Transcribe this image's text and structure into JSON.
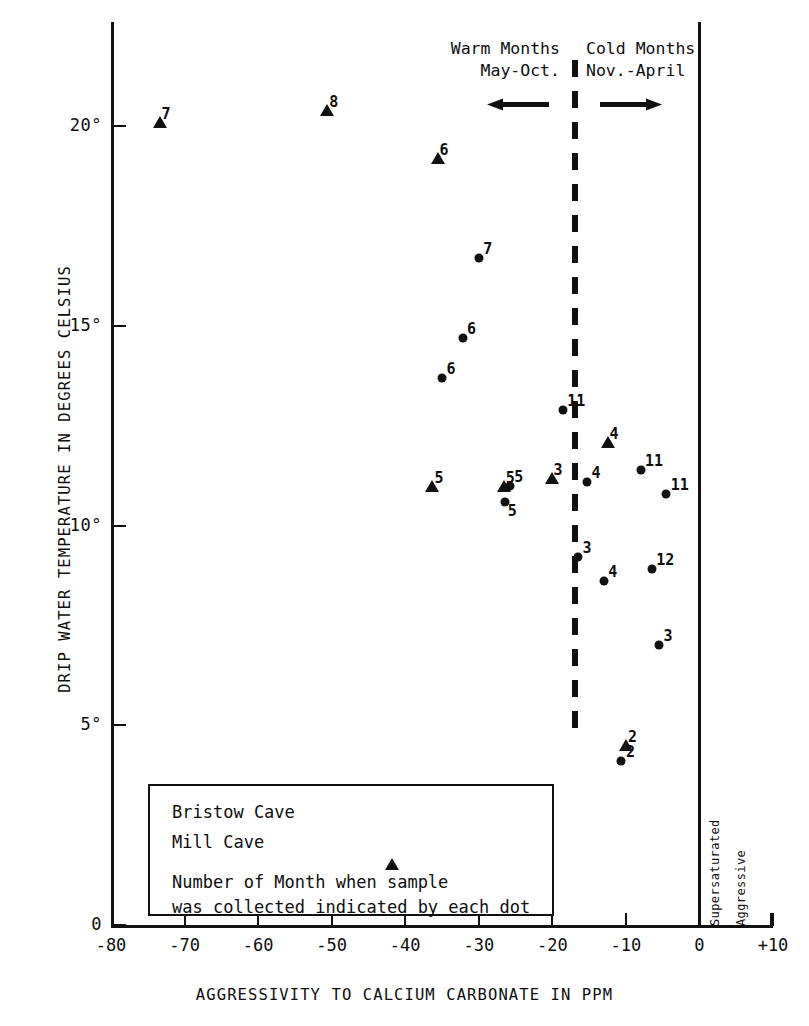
{
  "chart_data": {
    "type": "scatter",
    "title": "",
    "xlabel": "AGGRESSIVITY TO CALCIUM CARBONATE IN PPM",
    "ylabel": "DRIP WATER TEMPERATURE IN DEGREES CELSIUS",
    "xlim": [
      -80,
      10
    ],
    "ylim": [
      0,
      22.5
    ],
    "xticks": [
      "-80",
      "-70",
      "-60",
      "-50",
      "-40",
      "-30",
      "-20",
      "-10",
      "0",
      "+10"
    ],
    "xtick_values": [
      -80,
      -70,
      -60,
      -50,
      -40,
      -30,
      -20,
      -10,
      0,
      10
    ],
    "yticks": [
      "0",
      "5°",
      "10°",
      "15°",
      "20°"
    ],
    "ytick_values": [
      0,
      5,
      10,
      15,
      20
    ],
    "grid": false,
    "legend_position": "inside-lower-left",
    "series": [
      {
        "name": "Bristow Cave",
        "marker": "circle",
        "points": [
          {
            "x": -30.0,
            "y": 16.7,
            "label": "7"
          },
          {
            "x": -32.2,
            "y": 14.7,
            "label": "6"
          },
          {
            "x": -35.0,
            "y": 13.7,
            "label": "6"
          },
          {
            "x": -18.6,
            "y": 12.9,
            "label": "11"
          },
          {
            "x": -8.0,
            "y": 11.4,
            "label": "11"
          },
          {
            "x": -4.5,
            "y": 10.8,
            "label": "11"
          },
          {
            "x": -25.8,
            "y": 11.0,
            "label": "5"
          },
          {
            "x": -26.4,
            "y": 10.6,
            "label": "5"
          },
          {
            "x": -15.3,
            "y": 11.1,
            "label": "4"
          },
          {
            "x": -16.5,
            "y": 9.2,
            "label": "3"
          },
          {
            "x": -13.0,
            "y": 8.6,
            "label": "4"
          },
          {
            "x": -6.5,
            "y": 8.9,
            "label": "12"
          },
          {
            "x": -5.5,
            "y": 7.0,
            "label": "3"
          },
          {
            "x": -10.6,
            "y": 4.1,
            "label": "2"
          }
        ]
      },
      {
        "name": "Mill Cave",
        "marker": "triangle",
        "points": [
          {
            "x": -73.4,
            "y": 20.1,
            "label": "7"
          },
          {
            "x": -50.6,
            "y": 20.4,
            "label": "8"
          },
          {
            "x": -35.6,
            "y": 19.2,
            "label": "6"
          },
          {
            "x": -36.3,
            "y": 11.0,
            "label": "5"
          },
          {
            "x": -26.6,
            "y": 11.0,
            "label": "5"
          },
          {
            "x": -20.1,
            "y": 11.2,
            "label": "3"
          },
          {
            "x": -12.5,
            "y": 12.1,
            "label": "4"
          },
          {
            "x": -10.0,
            "y": 4.5,
            "label": "2"
          }
        ]
      }
    ],
    "annotations": {
      "divider_x": -20,
      "divider_style": "dashed-vertical",
      "warm": {
        "line1": "Warm Months",
        "line2": "May-Oct.",
        "arrow": "left"
      },
      "cold": {
        "line1": "Cold Months",
        "line2": "Nov.-April",
        "arrow": "right"
      },
      "zero_line_left_label": "Supersaturated",
      "zero_line_right_label": "Aggressive"
    }
  },
  "legend": {
    "rows": [
      {
        "name": "Bristow Cave",
        "marker": "circle"
      },
      {
        "name": "Mill Cave",
        "marker": "triangle"
      }
    ],
    "note_line1": "Number of Month when sample",
    "note_line2": "was collected indicated by each dot"
  }
}
